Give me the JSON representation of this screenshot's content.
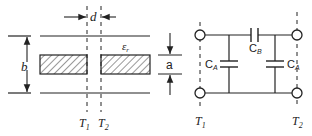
{
  "left_diagram": {
    "gap_label": "d",
    "height_label": "b",
    "thickness_label": "a",
    "dielectric_label": "ε",
    "dielectric_sub": "r",
    "ref_plane_1": "T",
    "ref_plane_1_sub": "1",
    "ref_plane_2": "T",
    "ref_plane_2_sub": "2"
  },
  "right_circuit": {
    "shunt_cap_left": "C",
    "shunt_cap_left_sub": "A",
    "series_cap": "C",
    "series_cap_sub": "B",
    "shunt_cap_right": "C",
    "shunt_cap_right_sub": "A",
    "port_1": "T",
    "port_1_sub": "1",
    "port_2": "T",
    "port_2_sub": "2"
  },
  "colors": {
    "line": "#222222",
    "background": "#ffffff"
  }
}
